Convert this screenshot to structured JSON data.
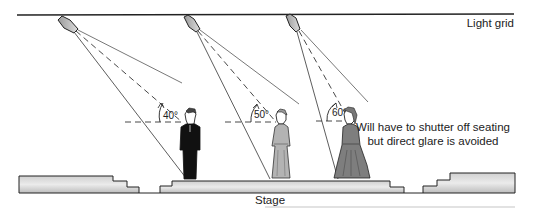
{
  "labels": {
    "light_grid": "Light grid",
    "stage": "Stage",
    "note": "Will have to shutter off seating but direct glare is avoided"
  },
  "angles": [
    {
      "id": "light-1",
      "label": "40°",
      "degrees": 40
    },
    {
      "id": "light-2",
      "label": "50°",
      "degrees": 50
    },
    {
      "id": "light-3",
      "label": "60°",
      "degrees": 60
    }
  ],
  "figures": [
    "man-in-suit",
    "woman-in-dress",
    "woman-in-gown"
  ],
  "colors": {
    "line": "#222222",
    "fill_light": "#e2e2e2",
    "fill_dark": "#b4b4b4",
    "figure_dark": "#111111",
    "dress_mid": "#a9a9a9",
    "gown_dark": "#7c7c7c"
  }
}
